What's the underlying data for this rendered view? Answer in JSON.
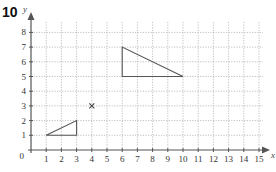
{
  "question_number": "10",
  "chart_data": {
    "type": "scatter",
    "title": "",
    "xlabel": "x",
    "ylabel": "y",
    "xlim": [
      0,
      15
    ],
    "ylim": [
      0,
      8
    ],
    "grid": true,
    "grid_style": "dotted",
    "x_ticks": [
      "1",
      "2",
      "3",
      "4",
      "5",
      "6",
      "7",
      "8",
      "9",
      "10",
      "11",
      "12",
      "13",
      "14",
      "15"
    ],
    "y_ticks": [
      "1",
      "2",
      "3",
      "4",
      "5",
      "6",
      "7",
      "8"
    ],
    "origin_label": "0",
    "shapes": [
      {
        "name": "small-triangle",
        "type": "polygon",
        "points": [
          [
            1,
            1
          ],
          [
            3,
            1
          ],
          [
            3,
            2
          ]
        ]
      },
      {
        "name": "large-triangle",
        "type": "polygon",
        "points": [
          [
            6,
            5
          ],
          [
            10,
            5
          ],
          [
            6,
            7
          ]
        ]
      }
    ],
    "markers": [
      {
        "name": "centre-cross",
        "symbol": "x",
        "point": [
          4,
          3
        ]
      }
    ],
    "colors": {
      "axis": "#555555",
      "grid": "#b0b0b0",
      "shape": "#555555"
    }
  }
}
